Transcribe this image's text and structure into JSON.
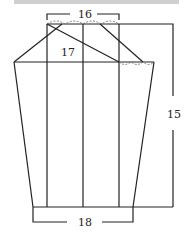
{
  "diagram": {
    "type": "pattern-drafting-schematic",
    "top_text_strip": "cropped caption text (illegible)",
    "labels": {
      "top_width": "16",
      "inner_label": "17",
      "height": "15",
      "bottom_width": "18"
    },
    "colors": {
      "line": "#222222",
      "background": "#ffffff"
    }
  }
}
